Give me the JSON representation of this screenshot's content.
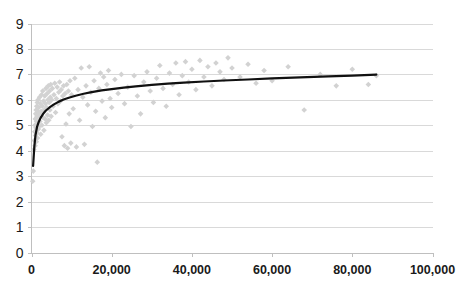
{
  "chart_data": {
    "type": "scatter",
    "title": "",
    "subtitle": "",
    "xlabel": "",
    "ylabel": "",
    "xlim": [
      0,
      100000
    ],
    "ylim": [
      0,
      9
    ],
    "grid": true,
    "legend": false,
    "legend_position": "none",
    "background_color": "#ffffff",
    "marker_color": "#d2d2d2",
    "marker_shape": "diamond",
    "trend_color": "#111111",
    "gridline_color": "#d9d9d9",
    "axis_color": "#bfbfbf",
    "xticks": [
      0,
      20000,
      40000,
      60000,
      80000,
      100000
    ],
    "xticklabels": [
      "0",
      "20,000",
      "40,000",
      "60,000",
      "80,000",
      "100,000"
    ],
    "yticks": [
      0,
      1,
      2,
      3,
      4,
      5,
      6,
      7,
      8,
      9
    ],
    "yticklabels": [
      "0",
      "1",
      "2",
      "3",
      "4",
      "5",
      "6",
      "7",
      "8",
      "9"
    ],
    "series": [
      {
        "name": "observations",
        "type": "scatter",
        "points": [
          [
            300,
            2.8
          ],
          [
            450,
            3.2
          ],
          [
            600,
            4.05
          ],
          [
            700,
            4.4
          ],
          [
            800,
            4.75
          ],
          [
            850,
            5.0
          ],
          [
            900,
            4.2
          ],
          [
            950,
            5.25
          ],
          [
            1000,
            4.6
          ],
          [
            1050,
            5.45
          ],
          [
            1100,
            4.9
          ],
          [
            1150,
            5.6
          ],
          [
            1200,
            4.35
          ],
          [
            1250,
            5.15
          ],
          [
            1300,
            5.75
          ],
          [
            1350,
            4.7
          ],
          [
            1400,
            5.35
          ],
          [
            1450,
            5.9
          ],
          [
            1500,
            4.5
          ],
          [
            1550,
            5.05
          ],
          [
            1600,
            5.55
          ],
          [
            1650,
            6.0
          ],
          [
            1700,
            4.85
          ],
          [
            1750,
            5.3
          ],
          [
            1800,
            5.7
          ],
          [
            1900,
            4.95
          ],
          [
            1950,
            5.45
          ],
          [
            2000,
            6.1
          ],
          [
            2100,
            5.15
          ],
          [
            2200,
            5.85
          ],
          [
            2300,
            4.65
          ],
          [
            2400,
            5.55
          ],
          [
            2500,
            6.2
          ],
          [
            2600,
            5.0
          ],
          [
            2700,
            5.75
          ],
          [
            2800,
            6.35
          ],
          [
            2900,
            5.3
          ],
          [
            3000,
            5.95
          ],
          [
            3100,
            4.8
          ],
          [
            3200,
            5.6
          ],
          [
            3300,
            6.15
          ],
          [
            3400,
            5.25
          ],
          [
            3500,
            5.85
          ],
          [
            3600,
            6.45
          ],
          [
            3700,
            5.1
          ],
          [
            3800,
            5.7
          ],
          [
            3900,
            6.25
          ],
          [
            4000,
            5.4
          ],
          [
            4100,
            6.0
          ],
          [
            4200,
            6.55
          ],
          [
            4300,
            5.2
          ],
          [
            4400,
            5.9
          ],
          [
            4500,
            6.35
          ],
          [
            4600,
            5.6
          ],
          [
            4700,
            6.1
          ],
          [
            4800,
            6.6
          ],
          [
            4900,
            5.35
          ],
          [
            5000,
            6.0
          ],
          [
            5200,
            6.45
          ],
          [
            5400,
            5.75
          ],
          [
            5600,
            6.2
          ],
          [
            5800,
            6.65
          ],
          [
            6000,
            5.5
          ],
          [
            6200,
            6.05
          ],
          [
            6400,
            6.5
          ],
          [
            6600,
            5.85
          ],
          [
            6800,
            6.3
          ],
          [
            7000,
            6.7
          ],
          [
            7200,
            5.95
          ],
          [
            7400,
            6.4
          ],
          [
            7600,
            4.55
          ],
          [
            7800,
            6.15
          ],
          [
            8000,
            6.55
          ],
          [
            8200,
            4.2
          ],
          [
            8400,
            6.25
          ],
          [
            8600,
            5.05
          ],
          [
            8800,
            6.6
          ],
          [
            9000,
            4.1
          ],
          [
            9200,
            6.35
          ],
          [
            9400,
            5.45
          ],
          [
            9600,
            6.75
          ],
          [
            9800,
            4.3
          ],
          [
            10000,
            6.2
          ],
          [
            10400,
            5.65
          ],
          [
            10800,
            6.85
          ],
          [
            11200,
            4.15
          ],
          [
            11600,
            6.4
          ],
          [
            12000,
            5.2
          ],
          [
            12400,
            7.25
          ],
          [
            12800,
            6.1
          ],
          [
            13200,
            4.25
          ],
          [
            13600,
            6.55
          ],
          [
            14000,
            5.8
          ],
          [
            14400,
            7.3
          ],
          [
            14800,
            6.3
          ],
          [
            15200,
            4.95
          ],
          [
            15600,
            6.75
          ],
          [
            16000,
            5.55
          ],
          [
            16400,
            3.55
          ],
          [
            16800,
            6.45
          ],
          [
            17200,
            7.05
          ],
          [
            17600,
            5.95
          ],
          [
            18000,
            6.9
          ],
          [
            18400,
            5.3
          ],
          [
            18800,
            6.6
          ],
          [
            19200,
            7.15
          ],
          [
            19600,
            6.05
          ],
          [
            20000,
            5.7
          ],
          [
            20800,
            6.8
          ],
          [
            21600,
            6.25
          ],
          [
            22400,
            7.0
          ],
          [
            23200,
            5.85
          ],
          [
            24000,
            6.5
          ],
          [
            24800,
            4.95
          ],
          [
            25600,
            6.95
          ],
          [
            26400,
            6.15
          ],
          [
            27200,
            5.45
          ],
          [
            28000,
            6.7
          ],
          [
            28800,
            7.1
          ],
          [
            29600,
            6.35
          ],
          [
            30400,
            5.9
          ],
          [
            31200,
            6.85
          ],
          [
            32000,
            7.35
          ],
          [
            32800,
            6.45
          ],
          [
            33600,
            5.75
          ],
          [
            34400,
            7.05
          ],
          [
            35200,
            6.6
          ],
          [
            36000,
            7.45
          ],
          [
            36800,
            6.2
          ],
          [
            37600,
            6.95
          ],
          [
            38400,
            7.5
          ],
          [
            39200,
            6.7
          ],
          [
            40000,
            7.2
          ],
          [
            41000,
            6.4
          ],
          [
            42000,
            7.55
          ],
          [
            43000,
            6.9
          ],
          [
            44000,
            7.3
          ],
          [
            45000,
            6.55
          ],
          [
            46000,
            7.45
          ],
          [
            47000,
            7.1
          ],
          [
            48000,
            6.8
          ],
          [
            49000,
            7.65
          ],
          [
            50000,
            7.25
          ],
          [
            52000,
            6.9
          ],
          [
            54000,
            7.4
          ],
          [
            56000,
            6.65
          ],
          [
            58000,
            7.15
          ],
          [
            60000,
            6.75
          ],
          [
            64000,
            7.3
          ],
          [
            68000,
            5.6
          ],
          [
            72000,
            7.0
          ],
          [
            76000,
            6.55
          ],
          [
            80000,
            7.2
          ],
          [
            84000,
            6.6
          ],
          [
            86000,
            6.95
          ]
        ]
      },
      {
        "name": "trend",
        "type": "line",
        "points": [
          [
            400,
            3.4
          ],
          [
            700,
            4.15
          ],
          [
            1000,
            4.62
          ],
          [
            1400,
            4.95
          ],
          [
            1800,
            5.13
          ],
          [
            2300,
            5.3
          ],
          [
            2900,
            5.45
          ],
          [
            3600,
            5.58
          ],
          [
            4500,
            5.7
          ],
          [
            5500,
            5.81
          ],
          [
            6700,
            5.92
          ],
          [
            8000,
            6.01
          ],
          [
            9500,
            6.09
          ],
          [
            11000,
            6.16
          ],
          [
            13000,
            6.24
          ],
          [
            15000,
            6.3
          ],
          [
            17500,
            6.37
          ],
          [
            20000,
            6.42
          ],
          [
            23000,
            6.48
          ],
          [
            26000,
            6.53
          ],
          [
            30000,
            6.59
          ],
          [
            34000,
            6.64
          ],
          [
            38000,
            6.68
          ],
          [
            43000,
            6.72
          ],
          [
            48000,
            6.76
          ],
          [
            54000,
            6.8
          ],
          [
            60000,
            6.84
          ],
          [
            67000,
            6.88
          ],
          [
            74000,
            6.92
          ],
          [
            80000,
            6.95
          ],
          [
            86000,
            6.99
          ]
        ]
      }
    ]
  }
}
